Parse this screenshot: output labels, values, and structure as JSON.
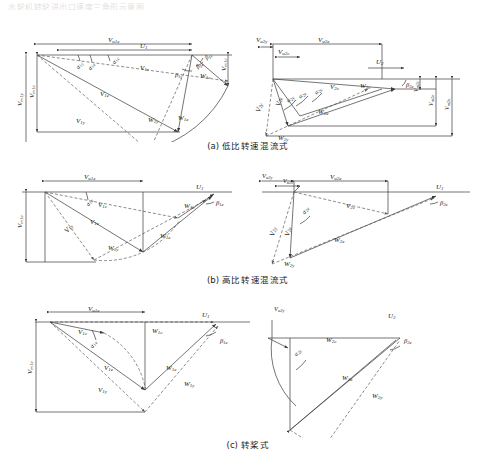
{
  "figure": {
    "header_faint": "水轮机转轮进出口速度三角形示意图",
    "type": "velocity-triangle-diagram",
    "panel_count": 3
  },
  "captions": {
    "a": {
      "tag": "(a)",
      "text": "低比转速混流式"
    },
    "b": {
      "tag": "(b)",
      "text": "高比转速混流式"
    },
    "c": {
      "tag": "(c)",
      "text": "转桨式"
    }
  },
  "symbols": {
    "U1": "U₁",
    "U2": "U₂",
    "Vu1e": "V",
    "Vu1e_sub": "u1e",
    "Vu2e": "V",
    "Vu2e_sub": "u2e",
    "Vu2y": "V",
    "Vu2y_sub": "u2y",
    "Vu2c": "V",
    "Vu2c_sub": "u2c",
    "Vm1e": "V",
    "Vm1e_sub": "m1e",
    "Vm1y": "V",
    "Vm1y_sub": "m1y",
    "Vm1c": "V",
    "Vm1c_sub": "m1c",
    "Vm2e": "V",
    "Vm2e_sub": "m2e",
    "Vm2y": "V",
    "Vm2y_sub": "m2y",
    "Vm2c": "V",
    "Vm2c_sub": "m2c",
    "V1e": "V",
    "V1e_sub": "1e",
    "V1y": "V",
    "V1y_sub": "1y",
    "V1c": "V",
    "V1c_sub": "1c",
    "V2e": "V",
    "V2e_sub": "2e",
    "V2y": "V",
    "V2y_sub": "2y",
    "V2c": "V",
    "V2c_sub": "2c",
    "W1e": "W",
    "W1e_sub": "1e",
    "W1y": "W",
    "W1y_sub": "1y",
    "W1c": "W",
    "W1c_sub": "1c",
    "W2e": "W",
    "W2e_sub": "2e",
    "W2y": "W",
    "W2y_sub": "2y",
    "W2c": "W",
    "W2c_sub": "2c",
    "a1e": "α",
    "a1e_sub": "1e",
    "a1y": "α",
    "a1y_sub": "1y",
    "a1c": "α",
    "a1c_sub": "1c",
    "a2e": "α",
    "a2e_sub": "2e",
    "a2y": "α",
    "a2y_sub": "2y",
    "a2c": "α",
    "a2c_sub": "2c",
    "b1e": "β",
    "b1e_sub": "1e",
    "b1y": "β",
    "b1y_sub": "1y",
    "b1c": "β",
    "b1c_sub": "1c",
    "b2e": "β",
    "b2e_sub": "2e",
    "b2y": "β",
    "b2y_sub": "2y"
  },
  "panel_a": {
    "name": "low-specific-speed-francis",
    "inlet": {
      "dim_top_outer": {
        "sym": "V",
        "sub": "u1e"
      },
      "dim_top_inner": {
        "sym": "U",
        "sub": "1"
      },
      "dim_left_outer": {
        "sym": "V",
        "sub": "m1y"
      },
      "dim_left_inner": {
        "sym": "V",
        "sub": "m1e"
      },
      "dim_right": {
        "sym": "V",
        "sub": "m1c"
      },
      "vectors": [
        {
          "sym": "V",
          "sub": "1c"
        },
        {
          "sym": "V",
          "sub": "1e"
        },
        {
          "sym": "V",
          "sub": "1y"
        },
        {
          "sym": "W",
          "sub": "1c"
        },
        {
          "sym": "W",
          "sub": "1e"
        },
        {
          "sym": "W",
          "sub": "1y"
        }
      ],
      "angles": [
        {
          "sym": "α",
          "sub": "1y"
        },
        {
          "sym": "α",
          "sub": "1e"
        },
        {
          "sym": "α",
          "sub": "1c"
        },
        {
          "sym": "β",
          "sub": "1y"
        },
        {
          "sym": "β",
          "sub": "1e"
        },
        {
          "sym": "β",
          "sub": "1c"
        }
      ]
    },
    "outlet": {
      "dim_top_outer": {
        "sym": "V",
        "sub": "u2e"
      },
      "dim_top_left": {
        "sym": "V",
        "sub": "u2y"
      },
      "dim_top_inner": {
        "sym": "V",
        "sub": "u2c"
      },
      "dim_right_outer": {
        "sym": "V",
        "sub": "m2y"
      },
      "dim_right_mid": {
        "sym": "V",
        "sub": "m2e"
      },
      "dim_right_inner": {
        "sym": "V",
        "sub": "m2c"
      },
      "u": {
        "sym": "U",
        "sub": "2"
      },
      "vectors": [
        {
          "sym": "V",
          "sub": "2y"
        },
        {
          "sym": "V",
          "sub": "2e"
        },
        {
          "sym": "V",
          "sub": "2c"
        },
        {
          "sym": "W",
          "sub": "2y"
        },
        {
          "sym": "W",
          "sub": "2e"
        },
        {
          "sym": "W",
          "sub": "2c"
        }
      ],
      "angles": [
        {
          "sym": "α",
          "sub": "2y"
        },
        {
          "sym": "α",
          "sub": "2e"
        },
        {
          "sym": "α",
          "sub": "2c"
        },
        {
          "sym": "β",
          "sub": "2e"
        }
      ]
    }
  },
  "panel_b": {
    "name": "high-specific-speed-francis",
    "inlet": {
      "dim_top": {
        "sym": "V",
        "sub": "u1e"
      },
      "dim_left": {
        "sym": "V",
        "sub": "m1e"
      },
      "u": {
        "sym": "U",
        "sub": "1"
      },
      "vectors": [
        {
          "sym": "V",
          "sub": "1c"
        },
        {
          "sym": "V",
          "sub": "1e"
        },
        {
          "sym": "V",
          "sub": "1y"
        },
        {
          "sym": "W",
          "sub": "1c"
        },
        {
          "sym": "W",
          "sub": "1e"
        },
        {
          "sym": "W",
          "sub": "1y"
        }
      ],
      "angles": [
        {
          "sym": "α",
          "sub": "1e"
        },
        {
          "sym": "β",
          "sub": "1e"
        }
      ]
    },
    "outlet": {
      "dim_top_outer": {
        "sym": "V",
        "sub": "u2e"
      },
      "dim_top_left": {
        "sym": "V",
        "sub": "u2y"
      },
      "dim_top_inner": {
        "sym": "V",
        "sub": "u2c"
      },
      "u": {
        "sym": "U",
        "sub": "1"
      },
      "vectors": [
        {
          "sym": "V",
          "sub": "2y"
        },
        {
          "sym": "V",
          "sub": "2e"
        },
        {
          "sym": "V",
          "sub": "2c"
        },
        {
          "sym": "W",
          "sub": "2y"
        },
        {
          "sym": "W",
          "sub": "2e"
        }
      ],
      "angles": [
        {
          "sym": "α",
          "sub": "2e"
        },
        {
          "sym": "β",
          "sub": "2e"
        }
      ]
    }
  },
  "panel_c": {
    "name": "kaplan-adjustable-blade",
    "inlet": {
      "dim_top": {
        "sym": "V",
        "sub": "u1e"
      },
      "dim_left": {
        "sym": "V",
        "sub": "m1e"
      },
      "u": {
        "sym": "U",
        "sub": "1"
      },
      "vectors": [
        {
          "sym": "V",
          "sub": "1c"
        },
        {
          "sym": "V",
          "sub": "1e"
        },
        {
          "sym": "V",
          "sub": "1y"
        },
        {
          "sym": "W",
          "sub": "1c"
        },
        {
          "sym": "W",
          "sub": "1e"
        },
        {
          "sym": "W",
          "sub": "1y"
        }
      ],
      "angles": [
        {
          "sym": "α",
          "sub": "1e"
        },
        {
          "sym": "β",
          "sub": "1e"
        }
      ]
    },
    "outlet": {
      "dim_top": {
        "sym": "V",
        "sub": "u2y"
      },
      "u": {
        "sym": "U",
        "sub": "2"
      },
      "vectors": [
        {
          "sym": "W",
          "sub": "2c"
        },
        {
          "sym": "W",
          "sub": "2e"
        },
        {
          "sym": "W",
          "sub": "2y"
        }
      ],
      "angles": [
        {
          "sym": "α",
          "sub": "2e"
        },
        {
          "sym": "β",
          "sub": "2e"
        }
      ]
    }
  },
  "style": {
    "line_color": "#3a3a3a",
    "dash_color": "#5a5a5a",
    "text_color": "#1c1c1c"
  }
}
